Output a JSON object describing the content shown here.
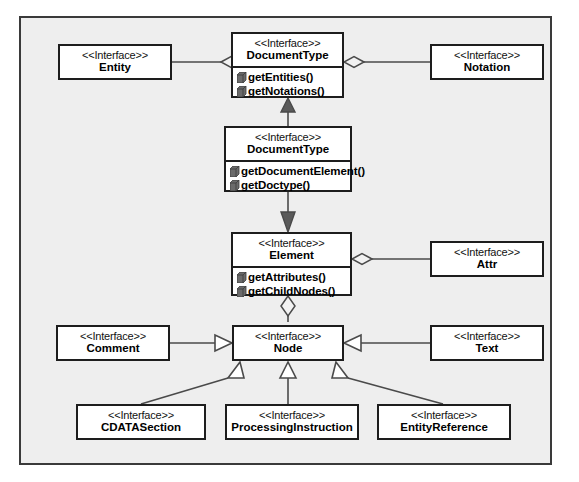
{
  "diagram": {
    "kind": "uml-class-diagram",
    "stereotype": "<<Interface>>",
    "background_color": "#eeeeee",
    "frame_color": "#3a3a3a",
    "box_fill": "#ffffff",
    "box_border": "#1d1d1d",
    "operation_icon": "method-box-icon",
    "classes": [
      {
        "id": "entity",
        "stereotype": "<<Interface>>",
        "name": "Entity",
        "operations": []
      },
      {
        "id": "documenttype_top",
        "stereotype": "<<Interface>>",
        "name": "DocumentType",
        "operations": [
          "getEntities()",
          "getNotations()"
        ]
      },
      {
        "id": "notation",
        "stereotype": "<<Interface>>",
        "name": "Notation",
        "operations": []
      },
      {
        "id": "document",
        "stereotype": "<<Interface>>",
        "name": "DocumentType",
        "operations": [
          "getDocumentElement()",
          "getDoctype()"
        ]
      },
      {
        "id": "element",
        "stereotype": "<<Interface>>",
        "name": "Element",
        "operations": [
          "getAttributes()",
          "getChildNodes()"
        ]
      },
      {
        "id": "attr",
        "stereotype": "<<Interface>>",
        "name": "Attr",
        "operations": []
      },
      {
        "id": "comment",
        "stereotype": "<<Interface>>",
        "name": "Comment",
        "operations": []
      },
      {
        "id": "node",
        "stereotype": "<<Interface>>",
        "name": "Node",
        "operations": []
      },
      {
        "id": "text",
        "stereotype": "<<Interface>>",
        "name": "Text",
        "operations": []
      },
      {
        "id": "cdatasection",
        "stereotype": "<<Interface>>",
        "name": "CDATASection",
        "operations": []
      },
      {
        "id": "processinginstruction",
        "stereotype": "<<Interface>>",
        "name": "ProcessingInstruction",
        "operations": []
      },
      {
        "id": "entityreference",
        "stereotype": "<<Interface>>",
        "name": "EntityReference",
        "operations": []
      }
    ],
    "relations": [
      {
        "from": "entity",
        "to": "documenttype_top",
        "type": "aggregation"
      },
      {
        "from": "notation",
        "to": "documenttype_top",
        "type": "aggregation"
      },
      {
        "from": "document",
        "to": "documenttype_top",
        "type": "generalization"
      },
      {
        "from": "document",
        "to": "element",
        "type": "generalization"
      },
      {
        "from": "attr",
        "to": "element",
        "type": "aggregation"
      },
      {
        "from": "element",
        "to": "node",
        "type": "aggregation"
      },
      {
        "from": "comment",
        "to": "node",
        "type": "generalization"
      },
      {
        "from": "text",
        "to": "node",
        "type": "generalization"
      },
      {
        "from": "cdatasection",
        "to": "node",
        "type": "generalization"
      },
      {
        "from": "processinginstruction",
        "to": "node",
        "type": "generalization"
      },
      {
        "from": "entityreference",
        "to": "node",
        "type": "generalization"
      }
    ]
  }
}
